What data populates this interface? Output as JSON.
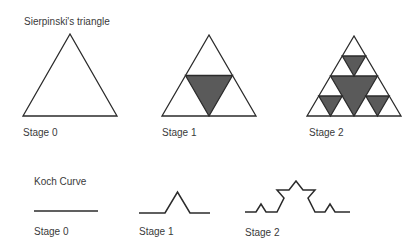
{
  "sierpinski": {
    "title": "Sierpinski's triangle",
    "stages": [
      {
        "label": "Stage 0"
      },
      {
        "label": "Stage 1"
      },
      {
        "label": "Stage 2"
      }
    ]
  },
  "koch": {
    "title": "Koch Curve",
    "stages": [
      {
        "label": "Stage 0"
      },
      {
        "label": "Stage 1"
      },
      {
        "label": "Stage 2"
      }
    ]
  },
  "colors": {
    "stroke": "#2b2b2b",
    "fill_dark": "#5a5a5a",
    "background": "#ffffff"
  }
}
